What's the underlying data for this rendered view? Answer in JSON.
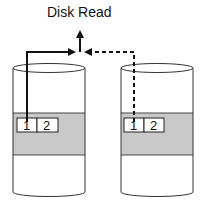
{
  "title": "Disk Read",
  "colors": {
    "stroke": "#222222",
    "band": "#c9c9c9",
    "background": "#ffffff"
  },
  "disks": [
    {
      "name": "disk-1",
      "blocks": [
        "1",
        "2"
      ],
      "connector": "solid"
    },
    {
      "name": "disk-2",
      "blocks": [
        "1",
        "2"
      ],
      "connector": "dashed"
    }
  ]
}
